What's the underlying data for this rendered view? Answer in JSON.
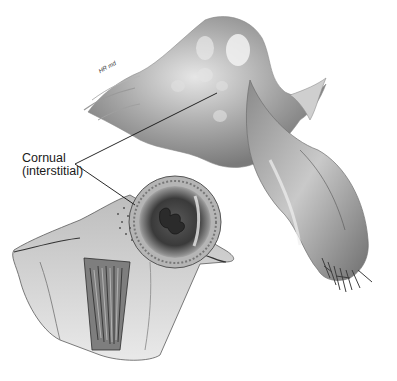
{
  "figure": {
    "label": {
      "line1": "Cornual",
      "line2": "(interstitial)"
    },
    "signature": "HR md",
    "colors": {
      "background": "#ffffff",
      "ink": "#1a1a1a",
      "tissue_light": "#d8d8d8",
      "tissue_mid": "#a6a6a6",
      "tissue_dark": "#4a4a4a"
    }
  }
}
